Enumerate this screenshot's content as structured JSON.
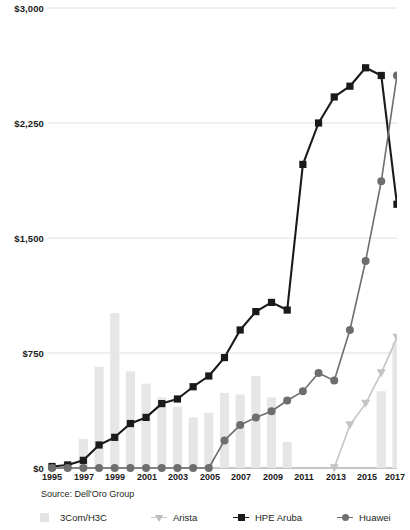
{
  "chart_data": {
    "type": "bar",
    "title": "",
    "subtitle": "",
    "xlabel": "",
    "ylabel": "",
    "ylim": [
      0,
      3000
    ],
    "y_ticks": [
      0,
      750,
      1500,
      2250,
      3000
    ],
    "y_tick_labels": [
      "$0",
      "$750",
      "$1,500",
      "$2,250",
      "$3,000"
    ],
    "grid": true,
    "legend_position": "bottom",
    "source": "Source: Dell'Oro Group",
    "categories": [
      1995,
      1996,
      1997,
      1998,
      1999,
      2000,
      2001,
      2002,
      2003,
      2004,
      2005,
      2006,
      2007,
      2008,
      2009,
      2010,
      2011,
      2012,
      2013,
      2014,
      2015,
      2016,
      2017
    ],
    "x_tick_labels": [
      "1995",
      "1997",
      "1999",
      "2001",
      "2003",
      "2005",
      "2007",
      "2009",
      "2011",
      "2013",
      "2015",
      "2017"
    ],
    "series": [
      {
        "name": "3Com/H3C",
        "type": "bar",
        "color": "#e6e6e6",
        "marker": "bar",
        "values": [
          10,
          35,
          190,
          660,
          1010,
          630,
          550,
          460,
          400,
          330,
          360,
          490,
          480,
          600,
          460,
          170,
          0,
          0,
          0,
          0,
          0,
          500,
          820
        ]
      },
      {
        "name": "Arista",
        "type": "line",
        "color": "#c4c4c4",
        "marker": "triangle",
        "values": [
          null,
          null,
          null,
          null,
          null,
          null,
          null,
          null,
          null,
          null,
          null,
          null,
          null,
          null,
          null,
          null,
          null,
          null,
          0,
          280,
          420,
          620,
          850
        ]
      },
      {
        "name": "HPE Aruba",
        "type": "line",
        "color": "#1a1a1a",
        "marker": "square",
        "values": [
          10,
          20,
          50,
          150,
          200,
          290,
          330,
          420,
          450,
          530,
          600,
          720,
          900,
          1020,
          1080,
          1030,
          1980,
          2250,
          2420,
          2490,
          2610,
          2560,
          1720
        ]
      },
      {
        "name": "Huawei",
        "type": "line",
        "color": "#6e6e6e",
        "marker": "circle",
        "values": [
          0,
          0,
          0,
          0,
          0,
          0,
          0,
          0,
          0,
          0,
          0,
          180,
          280,
          330,
          370,
          440,
          500,
          620,
          570,
          900,
          1350,
          1870,
          2560
        ]
      }
    ]
  },
  "axis": {
    "y_labels": [
      "$3,000",
      "$2,250",
      "$1,500",
      "$750",
      "$0"
    ],
    "x_labels": [
      "1995",
      "1997",
      "1999",
      "2001",
      "2003",
      "2005",
      "2007",
      "2009",
      "2011",
      "2013",
      "2015",
      "2017"
    ]
  },
  "footer": {
    "source": "Source: Dell'Oro Group"
  },
  "legend": {
    "items": [
      {
        "label": "3Com/H3C",
        "marker": "bar",
        "color": "#e3e3e3"
      },
      {
        "label": "Arista",
        "marker": "triangle",
        "color": "#bdbdbd"
      },
      {
        "label": "HPE Aruba",
        "marker": "square",
        "color": "#1a1a1a"
      },
      {
        "label": "Huawei",
        "marker": "circle",
        "color": "#6e6e6e"
      }
    ]
  }
}
